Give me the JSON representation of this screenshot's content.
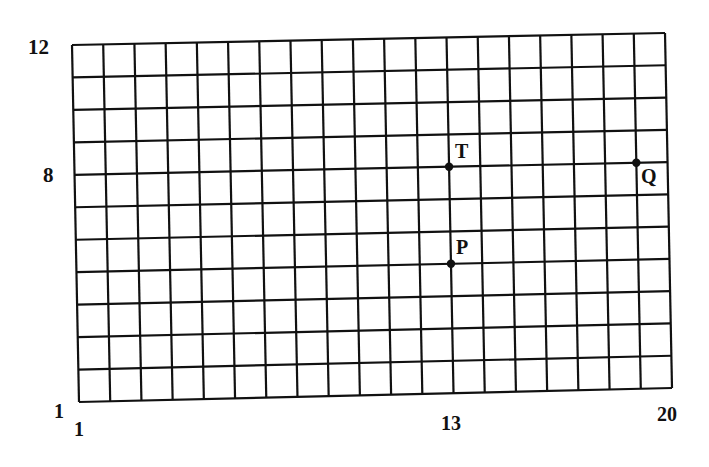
{
  "diagram": {
    "type": "coordinate-grid",
    "x_range": [
      1,
      20
    ],
    "y_range": [
      1,
      12
    ],
    "columns": 19,
    "rows": 11,
    "axis_labels": {
      "y_top": "12",
      "y_mid": "8",
      "y_bottom": "1",
      "x_left": "1",
      "x_mid": "13",
      "x_right": "20"
    },
    "points": [
      {
        "name": "T",
        "x": 13,
        "y": 8
      },
      {
        "name": "P",
        "x": 13,
        "y": 5
      },
      {
        "name": "Q",
        "x": 19,
        "y": 8
      }
    ],
    "line_color": "#111111",
    "background": "#ffffff"
  }
}
